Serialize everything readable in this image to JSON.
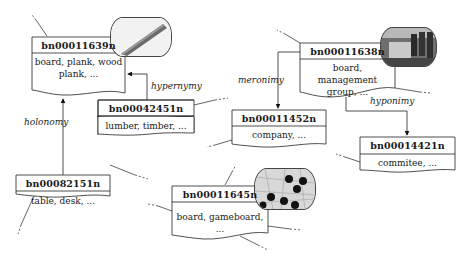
{
  "diagram": {
    "type": "semantic-network",
    "nodes": [
      {
        "id": "bn00011639n",
        "synonyms": "board, plank, wood plank, ...",
        "body_lines": [
          "board, plank, wood",
          "plank, ..."
        ],
        "image": "plank-thumbnail"
      },
      {
        "id": "bn00042451n",
        "synonyms": "lumber, timber, ...",
        "body_lines": [
          "lumber, timber, ..."
        ]
      },
      {
        "id": "bn00082151n",
        "synonyms": "table, desk, ...",
        "body_lines": [
          "table, desk, ..."
        ]
      },
      {
        "id": "bn00011638n",
        "synonyms": "board, management group, ...",
        "body_lines": [
          "board, management",
          "group, ..."
        ],
        "image": "boardroom-thumbnail"
      },
      {
        "id": "bn00011452n",
        "synonyms": "company, ...",
        "body_lines": [
          "company, ..."
        ]
      },
      {
        "id": "bn00014421n",
        "synonyms": "commitee, ...",
        "body_lines": [
          "commitee, ..."
        ]
      },
      {
        "id": "bn00011645n",
        "synonyms": "board, gameboard, ...",
        "body_lines": [
          "board, gameboard,  ..."
        ],
        "image": "go-board-thumbnail"
      }
    ],
    "edges": [
      {
        "from": "bn00082151n",
        "to": "bn00011639n",
        "label": "holonomy"
      },
      {
        "from": "bn00042451n",
        "to": "bn00011639n",
        "label": "hypernymy"
      },
      {
        "from": "bn00011638n",
        "to": "bn00011452n",
        "label": "meronimy"
      },
      {
        "from": "bn00011638n",
        "to": "bn00014421n",
        "label": "hyponimy"
      }
    ],
    "colors": {
      "line": "#222222",
      "box_fill": "#ffffff",
      "text": "#1a1a1a"
    }
  }
}
